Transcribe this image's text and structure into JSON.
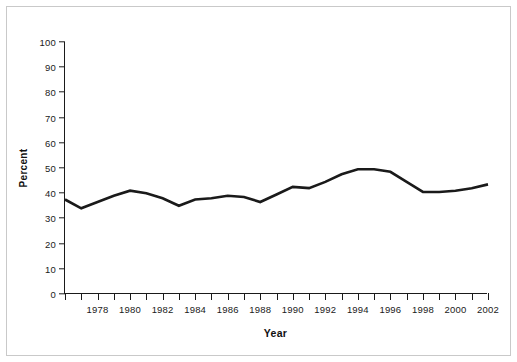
{
  "chart_data": {
    "type": "line",
    "title": "",
    "xlabel": "Year",
    "ylabel": "Percent",
    "xlim": [
      1976,
      2002
    ],
    "ylim": [
      0,
      100
    ],
    "grid": false,
    "legend": null,
    "y_ticks": [
      0,
      10,
      20,
      30,
      40,
      50,
      60,
      70,
      80,
      90,
      100
    ],
    "y_tick_labels": [
      "0",
      "10",
      "20",
      "30",
      "40",
      "50",
      "60",
      "70",
      "80",
      "90",
      "100"
    ],
    "x_ticks": [
      1976,
      1977,
      1978,
      1979,
      1980,
      1981,
      1982,
      1983,
      1984,
      1985,
      1986,
      1987,
      1988,
      1989,
      1990,
      1991,
      1992,
      1993,
      1994,
      1995,
      1996,
      1997,
      1998,
      1999,
      2000,
      2001,
      2002
    ],
    "x_tick_labels": [
      "",
      "",
      "1978",
      "",
      "1980",
      "",
      "1982",
      "",
      "1984",
      "",
      "1986",
      "",
      "1988",
      "",
      "1990",
      "",
      "1992",
      "",
      "1994",
      "",
      "1996",
      "",
      "1998",
      "",
      "2000",
      "",
      "2002"
    ],
    "x": [
      1976,
      1977,
      1978,
      1979,
      1980,
      1981,
      1982,
      1983,
      1984,
      1985,
      1986,
      1987,
      1988,
      1989,
      1990,
      1991,
      1992,
      1993,
      1994,
      1995,
      1996,
      1997,
      1998,
      1999,
      2000,
      2001,
      2002
    ],
    "values": [
      37.5,
      34.0,
      36.5,
      39.0,
      41.0,
      40.0,
      38.0,
      35.0,
      37.5,
      38.0,
      39.0,
      38.5,
      36.5,
      39.5,
      42.5,
      42.0,
      44.5,
      47.5,
      49.5,
      49.5,
      48.5,
      44.5,
      40.5,
      40.5,
      41.0,
      42.0,
      43.5
    ],
    "series": [
      {
        "name": "Percent",
        "color": "#1a1a1a",
        "values": [
          37.5,
          34.0,
          36.5,
          39.0,
          41.0,
          40.0,
          38.0,
          35.0,
          37.5,
          38.0,
          39.0,
          38.5,
          36.5,
          39.5,
          42.5,
          42.0,
          44.5,
          47.5,
          49.5,
          49.5,
          48.5,
          44.5,
          40.5,
          40.5,
          41.0,
          42.0,
          43.5
        ]
      }
    ]
  },
  "style": {
    "line_color": "#1a1a1a",
    "axis_color": "#1a1a1a",
    "frame_color": "#c9c9c9",
    "background": "#ffffff"
  }
}
